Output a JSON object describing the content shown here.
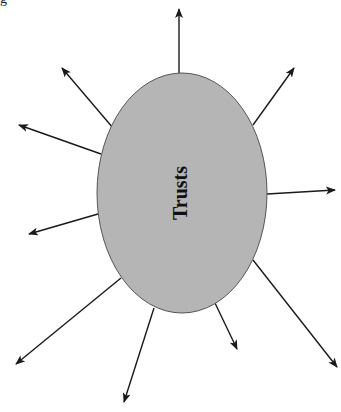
{
  "diagram": {
    "center": {
      "label": "Trusts",
      "cx": 182,
      "cy": 193,
      "rx": 85,
      "ry": 120,
      "fill": "#b5b5b5",
      "stroke": "#555555",
      "text_rotation": -90
    },
    "arrow_color": "#1a1a1a",
    "arrows": [
      {
        "name": "arrow-top",
        "x1": 179,
        "y1": 73,
        "x2": 179,
        "y2": 9
      },
      {
        "name": "arrow-upper-right",
        "x1": 253,
        "y1": 125,
        "x2": 294,
        "y2": 68
      },
      {
        "name": "arrow-right",
        "x1": 267,
        "y1": 194,
        "x2": 335,
        "y2": 190
      },
      {
        "name": "arrow-lower-right",
        "x1": 253,
        "y1": 260,
        "x2": 337,
        "y2": 367
      },
      {
        "name": "arrow-lower-short",
        "x1": 215,
        "y1": 303,
        "x2": 237,
        "y2": 349
      },
      {
        "name": "arrow-bottom-left",
        "x1": 154,
        "y1": 308,
        "x2": 124,
        "y2": 402
      },
      {
        "name": "arrow-lower-left",
        "x1": 121,
        "y1": 278,
        "x2": 16,
        "y2": 364
      },
      {
        "name": "arrow-left",
        "x1": 98,
        "y1": 214,
        "x2": 29,
        "y2": 234
      },
      {
        "name": "arrow-upper-left",
        "x1": 101,
        "y1": 154,
        "x2": 19,
        "y2": 125
      },
      {
        "name": "arrow-top-left",
        "x1": 113,
        "y1": 128,
        "x2": 62,
        "y2": 68
      }
    ]
  },
  "corner_fragment": "g"
}
